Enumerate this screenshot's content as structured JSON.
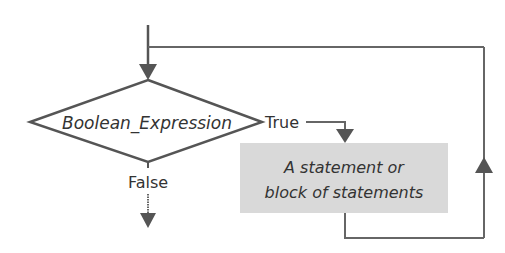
{
  "diagram": {
    "title": "",
    "decision": {
      "label": "Boolean_Expression",
      "shape": "diamond"
    },
    "true_branch": {
      "label": "True"
    },
    "false_branch": {
      "label": "False"
    },
    "process": {
      "line1": "A statement or",
      "line2": "block of statements",
      "shape": "rectangle"
    },
    "colors": {
      "stroke": "#555555",
      "process_fill": "#d9d9d9",
      "text": "#333333"
    },
    "edges": [
      {
        "from": "entry",
        "to": "decision",
        "label": ""
      },
      {
        "from": "decision",
        "to": "process",
        "label": "True"
      },
      {
        "from": "process",
        "to": "decision",
        "label": "",
        "kind": "loop-back"
      },
      {
        "from": "decision",
        "to": "exit",
        "label": "False"
      }
    ]
  }
}
